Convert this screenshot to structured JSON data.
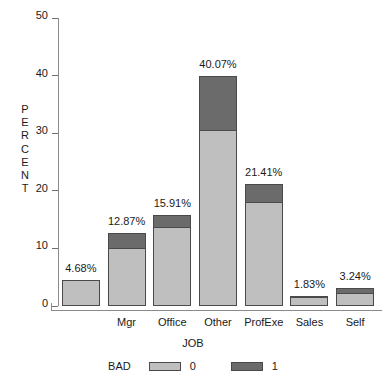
{
  "chart_data": {
    "type": "bar",
    "subtype": "stacked-bar",
    "title": "",
    "xlabel": "JOB",
    "ylabel": "PERCENT",
    "ylabel_letters": [
      "P",
      "E",
      "R",
      "C",
      "E",
      "N",
      "T"
    ],
    "categories": [
      "",
      "Mgr",
      "Office",
      "Other",
      "ProfExe",
      "Sales",
      "Self"
    ],
    "series": [
      {
        "name": "0",
        "color": "#bfbfbf",
        "values": [
          4.46,
          10.1,
          13.7,
          30.6,
          18.1,
          1.55,
          2.25
        ]
      },
      {
        "name": "1",
        "color": "#6b6b6b",
        "values": [
          0.22,
          2.77,
          2.21,
          9.47,
          3.31,
          0.28,
          0.99
        ]
      }
    ],
    "totals": [
      4.68,
      12.87,
      15.91,
      40.07,
      21.41,
      1.83,
      3.24
    ],
    "data_labels": [
      "4.68%",
      "12.87%",
      "15.91%",
      "40.07%",
      "21.41%",
      "1.83%",
      "3.24%"
    ],
    "yticks": [
      0,
      10,
      20,
      30,
      40,
      50
    ],
    "ytick_labels": [
      "0",
      "10",
      "20",
      "30",
      "40",
      "50"
    ],
    "ylim": [
      0,
      50
    ],
    "grid": false,
    "legend": {
      "title": "BAD",
      "position": "bottom",
      "entries": [
        {
          "label": "0",
          "color": "#bfbfbf"
        },
        {
          "label": "1",
          "color": "#6b6b6b"
        }
      ]
    },
    "axis_color": "#8a8a8a",
    "bar_border_color": "#4a4a4a",
    "background": "#ffffff"
  }
}
